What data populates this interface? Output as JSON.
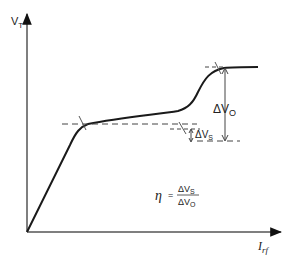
{
  "diagram": {
    "y_axis_label_main": "V",
    "y_axis_label_sub": "T",
    "x_axis_label_main": "I",
    "x_axis_label_sub": "rf",
    "delta_vo_main": "ΔV",
    "delta_vo_sub": "O",
    "delta_vs_main": "ΔV",
    "delta_vs_sub": "S",
    "formula": {
      "symbol": "η",
      "equals": "=",
      "numerator_main": "ΔV",
      "numerator_sub": "S",
      "denominator_main": "ΔV",
      "denominator_sub": "O"
    },
    "colors": {
      "curve": "#1a1a1a",
      "axis": "#555555",
      "dashed": "#444444"
    }
  }
}
